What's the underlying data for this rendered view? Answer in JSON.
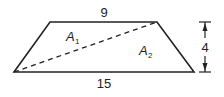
{
  "figure": {
    "type": "trapezoid",
    "top_base_label": "9",
    "bottom_base_label": "15",
    "height_label": "4",
    "regions": [
      {
        "name": "A",
        "subscript": "1"
      },
      {
        "name": "A",
        "subscript": "2"
      }
    ],
    "diagonal": "dashed",
    "stroke_color": "#222222"
  }
}
